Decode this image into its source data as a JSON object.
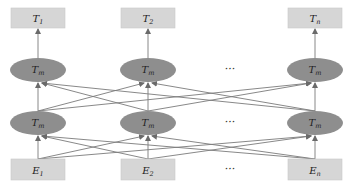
{
  "diagram": {
    "colors": {
      "box_fill": "#d6d6d6",
      "box_stroke": "#c8c8c8",
      "ellipse_fill": "#8e8e8e",
      "line": "#7a7a7a",
      "text": "#222222"
    },
    "columns_x": [
      38,
      148,
      315
    ],
    "ellipsis_x": 230,
    "output_layer": {
      "y": 8,
      "h": 20,
      "w": 54,
      "nodes": [
        {
          "label": "T",
          "sub": "1"
        },
        {
          "label": "T",
          "sub": "2"
        },
        {
          "label": "T",
          "sub": "n"
        }
      ],
      "ellipsis": "···"
    },
    "upper_transformer_layer": {
      "cy": 70,
      "rx": 28,
      "ry": 12,
      "nodes": [
        {
          "label": "T",
          "sub": "m"
        },
        {
          "label": "T",
          "sub": "m"
        },
        {
          "label": "T",
          "sub": "m"
        }
      ],
      "ellipsis": "···"
    },
    "lower_transformer_layer": {
      "cy": 123,
      "rx": 28,
      "ry": 12,
      "nodes": [
        {
          "label": "T",
          "sub": "m"
        },
        {
          "label": "T",
          "sub": "m"
        },
        {
          "label": "T",
          "sub": "m"
        }
      ],
      "ellipsis": "···"
    },
    "input_layer": {
      "y": 159,
      "h": 21,
      "w": 54,
      "nodes": [
        {
          "label": "E",
          "sub": "1"
        },
        {
          "label": "E",
          "sub": "2"
        },
        {
          "label": "E",
          "sub": "n"
        }
      ],
      "ellipsis": "···"
    }
  }
}
